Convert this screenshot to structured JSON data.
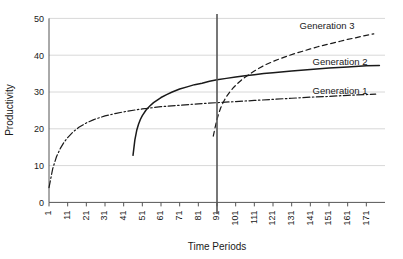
{
  "chart_data": {
    "type": "line",
    "title": "",
    "xlabel": "Time Periods",
    "ylabel": "Productivity",
    "xlim": [
      1,
      181
    ],
    "ylim": [
      0,
      50
    ],
    "grid": true,
    "legend_position": "right-inline",
    "x_ticks": [
      "1",
      "11",
      "21",
      "31",
      "41",
      "51",
      "61",
      "71",
      "81",
      "91",
      "101",
      "111",
      "121",
      "131",
      "141",
      "151",
      "161",
      "171"
    ],
    "y_ticks": [
      "0",
      "10",
      "20",
      "30",
      "40",
      "50"
    ],
    "annotations": [
      {
        "name": "vertical-reference-line",
        "x": 91,
        "style": "solid",
        "color": "#555555"
      }
    ],
    "series": [
      {
        "name": "Generation 1",
        "label": "Generation 1",
        "style": "dash-dot",
        "color": "#1a1a1a",
        "x_start": 1,
        "x_end": 176,
        "points": [
          [
            1,
            4.0
          ],
          [
            3,
            9.2
          ],
          [
            5,
            12.4
          ],
          [
            7,
            14.6
          ],
          [
            9,
            16.3
          ],
          [
            11,
            17.6
          ],
          [
            14,
            19.2
          ],
          [
            17,
            20.4
          ],
          [
            21,
            21.6
          ],
          [
            25,
            22.5
          ],
          [
            31,
            23.5
          ],
          [
            37,
            24.2
          ],
          [
            43,
            24.8
          ],
          [
            51,
            25.4
          ],
          [
            61,
            26.0
          ],
          [
            71,
            26.4
          ],
          [
            81,
            26.8
          ],
          [
            91,
            27.1
          ],
          [
            101,
            27.4
          ],
          [
            111,
            27.7
          ],
          [
            121,
            28.0
          ],
          [
            131,
            28.3
          ],
          [
            141,
            28.6
          ],
          [
            151,
            28.8
          ],
          [
            161,
            29.1
          ],
          [
            171,
            29.3
          ],
          [
            176,
            29.4
          ]
        ]
      },
      {
        "name": "Generation 2",
        "label": "Generation 2",
        "style": "solid",
        "color": "#1a1a1a",
        "x_start": 46,
        "x_end": 178,
        "points": [
          [
            46,
            12.8
          ],
          [
            47,
            17.0
          ],
          [
            48,
            19.6
          ],
          [
            49,
            21.3
          ],
          [
            50,
            22.6
          ],
          [
            51,
            23.6
          ],
          [
            53,
            25.1
          ],
          [
            55,
            26.2
          ],
          [
            57,
            27.1
          ],
          [
            59,
            27.8
          ],
          [
            61,
            28.5
          ],
          [
            64,
            29.3
          ],
          [
            67,
            30.0
          ],
          [
            71,
            30.8
          ],
          [
            75,
            31.4
          ],
          [
            79,
            32.0
          ],
          [
            83,
            32.4
          ],
          [
            87,
            32.9
          ],
          [
            91,
            33.3
          ],
          [
            96,
            33.7
          ],
          [
            101,
            34.1
          ],
          [
            106,
            34.4
          ],
          [
            111,
            34.7
          ],
          [
            116,
            35.0
          ],
          [
            121,
            35.2
          ],
          [
            131,
            35.7
          ],
          [
            141,
            36.1
          ],
          [
            151,
            36.5
          ],
          [
            161,
            36.8
          ],
          [
            171,
            37.1
          ],
          [
            178,
            37.2
          ]
        ]
      },
      {
        "name": "Generation 3",
        "label": "Generation 3",
        "style": "dashed",
        "color": "#1a1a1a",
        "x_start": 89,
        "x_end": 175,
        "points": [
          [
            89,
            18.0
          ],
          [
            90,
            20.4
          ],
          [
            91,
            22.6
          ],
          [
            92,
            24.3
          ],
          [
            93,
            25.7
          ],
          [
            94,
            26.8
          ],
          [
            95,
            27.8
          ],
          [
            96,
            28.7
          ],
          [
            98,
            30.1
          ],
          [
            100,
            31.3
          ],
          [
            102,
            32.3
          ],
          [
            104,
            33.2
          ],
          [
            106,
            34.0
          ],
          [
            108,
            34.7
          ],
          [
            111,
            35.7
          ],
          [
            114,
            36.6
          ],
          [
            117,
            37.4
          ],
          [
            121,
            38.3
          ],
          [
            125,
            39.1
          ],
          [
            129,
            39.8
          ],
          [
            133,
            40.5
          ],
          [
            137,
            41.1
          ],
          [
            141,
            41.7
          ],
          [
            145,
            42.3
          ],
          [
            149,
            42.8
          ],
          [
            153,
            43.3
          ],
          [
            157,
            43.8
          ],
          [
            161,
            44.3
          ],
          [
            165,
            44.7
          ],
          [
            169,
            45.2
          ],
          [
            173,
            45.6
          ],
          [
            175,
            45.8
          ]
        ]
      }
    ]
  },
  "legend": {
    "items": [
      {
        "label": "Generation 3"
      },
      {
        "label": "Generation 2"
      },
      {
        "label": "Generation 1"
      }
    ]
  },
  "colors": {
    "line": "#1a1a1a",
    "grid": "#d8d8d8",
    "axis": "#555555",
    "text": "#1a1a1a",
    "background": "#ffffff"
  }
}
